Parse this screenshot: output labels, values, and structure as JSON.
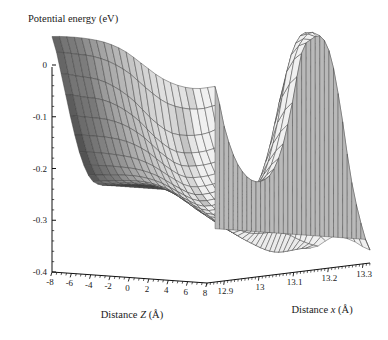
{
  "figure": {
    "title": "Potential energy (eV)",
    "background": "#ffffff",
    "line_color": "#3a3a3a"
  },
  "axes": {
    "z_axis": {
      "label_prefix": "Distance",
      "label_var": "Z",
      "label_unit": "(Å)",
      "label_full": "Distance Z (Å)",
      "ticks": [
        "-8",
        "-6",
        "-4",
        "-2",
        "0",
        "2",
        "4",
        "6",
        "8"
      ]
    },
    "x_axis": {
      "label_prefix": "Distance",
      "label_var": "x",
      "label_unit": "(Å)",
      "label_full": "Distance x (Å)",
      "ticks": [
        "12.9",
        "13",
        "13.1",
        "13.2",
        "13.3"
      ]
    },
    "v_axis": {
      "label_full": "Potential energy (eV)",
      "ticks": [
        "0",
        "-0.1",
        "-0.2",
        "-0.3",
        "-0.4"
      ]
    }
  },
  "chart_data": {
    "type": "surface",
    "title": "Potential energy (eV)",
    "xlabel": "Distance Z (Å)",
    "ylabel": "Distance x (Å)",
    "zlabel": "Potential energy (eV)",
    "grid": false,
    "legend": "none",
    "colormap": "grayscale-shaded",
    "surface_fill_light": "#d7d7d7",
    "surface_fill_dark": "#8a8a8a",
    "mesh_color": "#3c3c3c",
    "xlim": [
      -8,
      8
    ],
    "ylim": [
      12.85,
      13.32
    ],
    "zlim": [
      -0.4,
      0.06
    ],
    "x_ticks": [
      -8,
      -6,
      -4,
      -2,
      0,
      2,
      4,
      6,
      8
    ],
    "y_ticks": [
      12.9,
      13.0,
      13.1,
      13.2,
      13.3
    ],
    "z_ticks": [
      0,
      -0.1,
      -0.2,
      -0.3,
      -0.4
    ],
    "x_values": [
      -8,
      -7,
      -6,
      -5,
      -4,
      -3,
      -2,
      -1,
      0,
      1,
      2,
      3,
      4,
      5,
      6,
      7,
      8
    ],
    "y_values": [
      12.85,
      12.9,
      12.95,
      13.0,
      13.05,
      13.1,
      13.15,
      13.2,
      13.25,
      13.3
    ],
    "z_matrix": [
      [
        0.055,
        -0.02,
        -0.105,
        -0.175,
        -0.215,
        -0.225,
        -0.225,
        -0.225,
        -0.225,
        -0.225,
        -0.225,
        -0.225,
        -0.225,
        -0.225,
        -0.225,
        -0.225,
        -0.225
      ],
      [
        0.05,
        -0.03,
        -0.112,
        -0.18,
        -0.218,
        -0.228,
        -0.228,
        -0.228,
        -0.228,
        -0.228,
        -0.228,
        -0.228,
        -0.228,
        -0.228,
        -0.228,
        -0.228,
        -0.228
      ],
      [
        0.042,
        -0.04,
        -0.12,
        -0.188,
        -0.222,
        -0.232,
        -0.233,
        -0.233,
        -0.233,
        -0.233,
        -0.233,
        -0.233,
        -0.233,
        -0.233,
        -0.233,
        -0.233,
        -0.233
      ],
      [
        0.03,
        -0.06,
        -0.135,
        -0.198,
        -0.23,
        -0.24,
        -0.242,
        -0.244,
        -0.246,
        -0.248,
        -0.25,
        -0.252,
        -0.253,
        -0.254,
        -0.255,
        -0.255,
        -0.255
      ],
      [
        0.01,
        -0.09,
        -0.16,
        -0.215,
        -0.245,
        -0.258,
        -0.265,
        -0.27,
        -0.275,
        -0.28,
        -0.284,
        -0.288,
        -0.291,
        -0.293,
        -0.295,
        -0.296,
        -0.296
      ],
      [
        -0.02,
        -0.13,
        -0.195,
        -0.24,
        -0.268,
        -0.285,
        -0.298,
        -0.308,
        -0.318,
        -0.326,
        -0.332,
        -0.337,
        -0.341,
        -0.344,
        -0.346,
        -0.347,
        -0.348
      ],
      [
        -0.05,
        -0.16,
        -0.222,
        -0.262,
        -0.288,
        -0.305,
        -0.318,
        -0.33,
        -0.338,
        -0.345,
        -0.349,
        -0.352,
        -0.354,
        -0.355,
        -0.356,
        -0.356,
        -0.356
      ],
      [
        -0.07,
        -0.17,
        -0.228,
        -0.265,
        -0.288,
        -0.3,
        -0.305,
        -0.3,
        -0.285,
        -0.255,
        -0.205,
        -0.15,
        -0.12,
        -0.15,
        -0.23,
        -0.3,
        -0.34
      ],
      [
        -0.08,
        -0.17,
        -0.225,
        -0.258,
        -0.275,
        -0.278,
        -0.265,
        -0.225,
        -0.15,
        -0.05,
        0.01,
        0.03,
        0.005,
        -0.08,
        -0.2,
        -0.3,
        -0.352
      ],
      [
        -0.08,
        -0.16,
        -0.215,
        -0.245,
        -0.258,
        -0.255,
        -0.235,
        -0.185,
        -0.1,
        0.0,
        0.025,
        0.03,
        -0.01,
        -0.11,
        -0.235,
        -0.32,
        -0.375
      ]
    ]
  }
}
